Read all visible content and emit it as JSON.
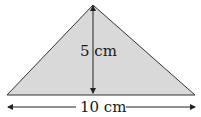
{
  "diagram": {
    "shape": "triangle",
    "fill_color": "#d9d9d9",
    "stroke_color": "#333333",
    "height_label": "5 cm",
    "base_label": "10 cm"
  }
}
